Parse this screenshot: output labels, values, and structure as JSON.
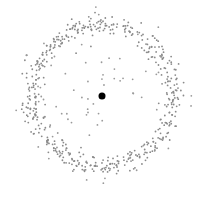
{
  "chart_data": {
    "type": "scatter",
    "title": "",
    "xlabel": "",
    "ylabel": "",
    "grid": false,
    "legend": null,
    "axes_visible": false,
    "center_point": {
      "x": 102,
      "y": 96,
      "radius": 3.5,
      "color": "#000000"
    },
    "ring": {
      "cx": 102,
      "cy": 96,
      "radius": 71,
      "band_width": 11,
      "count": 520,
      "point_radius": 0.9,
      "color": "#8a8a8a"
    },
    "scatter_outliers": {
      "count": 70,
      "min_r": 10,
      "max_r": 92,
      "point_radius": 0.9,
      "color": "#9a9a9a"
    },
    "seed": 12345,
    "canvas": {
      "width": 204,
      "height": 198,
      "background": "#ffffff"
    }
  }
}
